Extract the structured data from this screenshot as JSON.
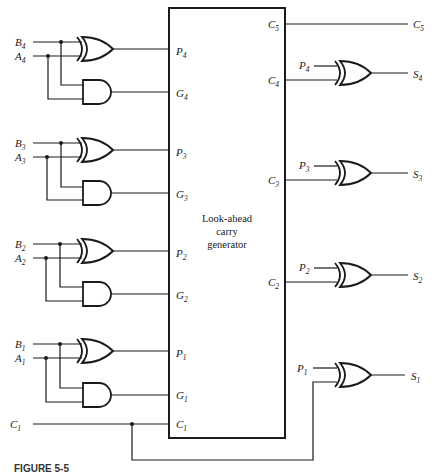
{
  "figure": {
    "caption": "FIGURE 5-5",
    "block_label_lines": [
      "Look-ahead",
      "carry",
      "generator"
    ]
  },
  "stages": [
    {
      "index": 4,
      "b": "B",
      "a": "A",
      "p": "P",
      "g": "G",
      "c": "C",
      "s": "S",
      "sub": "4"
    },
    {
      "index": 3,
      "b": "B",
      "a": "A",
      "p": "P",
      "g": "G",
      "c": "C",
      "s": "S",
      "sub": "3"
    },
    {
      "index": 2,
      "b": "B",
      "a": "A",
      "p": "P",
      "g": "G",
      "c": "C",
      "s": "S",
      "sub": "2"
    },
    {
      "index": 1,
      "b": "B",
      "a": "A",
      "p": "P",
      "g": "G",
      "c": "C",
      "s": "S",
      "sub": "1"
    }
  ],
  "carry_in": {
    "name": "C",
    "sub": "1"
  },
  "carry_out": {
    "name": "C",
    "sub": "5"
  }
}
